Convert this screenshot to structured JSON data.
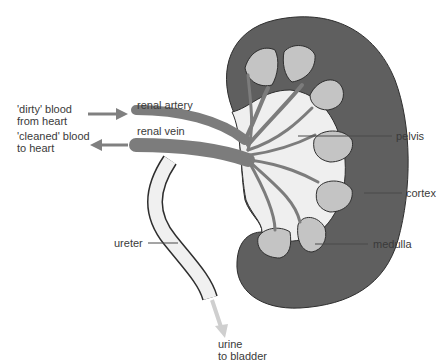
{
  "diagram": {
    "colors": {
      "cortex": "#5f5f5f",
      "medulla": "#c4c4c4",
      "pelvis": "#efefef",
      "vessels": "#7c7c7c",
      "ureter_fill": "#f0f0f0",
      "outline": "#2e2e2e",
      "arrow_blood": "#808080",
      "arrow_urine": "#cfcfcf",
      "leader": "#4a4a4a",
      "text": "#3a3a3a"
    },
    "labels": {
      "dirty_blood": "'dirty' blood\nfrom heart",
      "cleaned_blood": "'cleaned' blood\nto heart",
      "renal_artery": "renal artery",
      "renal_vein": "renal vein",
      "pelvis": "pelvis",
      "cortex": "cortex",
      "medulla": "medulla",
      "ureter": "ureter",
      "urine": "urine\nto bladder"
    }
  }
}
